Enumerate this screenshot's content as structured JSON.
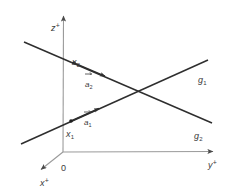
{
  "figure": {
    "background_color": "#ffffff",
    "stroke_color": "#3b3b3b",
    "axis_color": "#8f8f8f",
    "width": 235,
    "height": 187
  },
  "axes": [
    {
      "id": "z-axis",
      "label_base": "z",
      "label_sup": "+",
      "label_x": 51,
      "label_y": 18,
      "from": {
        "x": 63,
        "y": 152
      },
      "to": {
        "x": 63.5,
        "y": 13
      },
      "arrow": true
    },
    {
      "id": "y-axis",
      "label_base": "y",
      "label_sup": "+",
      "label_x": 208,
      "label_y": 155,
      "from": {
        "x": 63,
        "y": 152
      },
      "to": {
        "x": 216,
        "y": 151.5
      },
      "arrow": true
    },
    {
      "id": "x-axis",
      "label_base": "x",
      "label_sup": "+",
      "label_x": 40,
      "label_y": 173,
      "from": {
        "x": 63,
        "y": 152
      },
      "to": {
        "x": 38,
        "y": 172
      },
      "arrow": true
    }
  ],
  "origin": {
    "label": "0",
    "label_x": 61,
    "label_y": 158
  },
  "lines": [
    {
      "id": "g1",
      "label_base": "g",
      "label_sub": "1",
      "label_x": 198,
      "label_y": 70,
      "from": {
        "x": 21,
        "y": 144
      },
      "to": {
        "x": 208,
        "y": 60
      },
      "color": "#2e2e2e"
    },
    {
      "id": "g2",
      "label_base": "g",
      "label_sub": "2",
      "label_x": 194,
      "label_y": 126,
      "from": {
        "x": 24,
        "y": 42
      },
      "to": {
        "x": 212,
        "y": 123
      },
      "color": "#2e2e2e"
    }
  ],
  "points": [
    {
      "id": "x1",
      "label_base": "x",
      "label_sub": "1",
      "label_x": 66,
      "label_y": 124,
      "dot": {
        "x": 71,
        "y": 121
      },
      "on_line": "g1"
    },
    {
      "id": "x2",
      "label_base": "x",
      "label_sub": "2",
      "label_x": 72,
      "label_y": 52,
      "dot": {
        "x": 74,
        "y": 63
      },
      "on_line": "g2"
    }
  ],
  "vectors": [
    {
      "id": "a1",
      "label_base": "a",
      "label_sub": "1",
      "label_x": 84,
      "label_y": 112,
      "from": {
        "x": 71,
        "y": 121
      },
      "to": {
        "x": 101,
        "y": 108
      },
      "overbar": true,
      "on_line": "g1"
    },
    {
      "id": "a2",
      "label_base": "a",
      "label_sub": "2",
      "label_x": 85,
      "label_y": 74,
      "from": {
        "x": 74,
        "y": 63
      },
      "to": {
        "x": 107,
        "y": 77
      },
      "overbar": true,
      "on_line": "g2"
    }
  ]
}
